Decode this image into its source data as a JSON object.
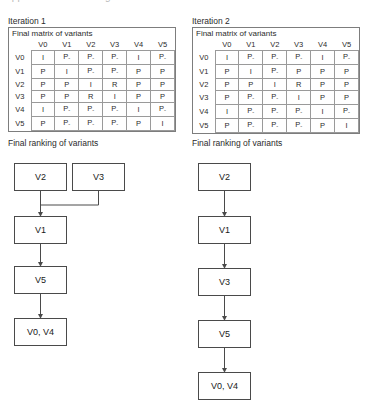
{
  "top_caption": "appendix: final ranking tables",
  "columns": [
    {
      "iteration_title": "Iteration 1",
      "matrix": {
        "caption": "Final matrix of variants",
        "col_headers": [
          "V0",
          "V1",
          "V2",
          "V3",
          "V4",
          "V5"
        ],
        "row_headers": [
          "V0",
          "V1",
          "V2",
          "V3",
          "V4",
          "V5"
        ],
        "rows": [
          [
            "I",
            "P-",
            "P-",
            "P-",
            "I",
            "P-"
          ],
          [
            "P",
            "I",
            "P-",
            "P-",
            "P",
            "P"
          ],
          [
            "P",
            "P",
            "I",
            "R",
            "P",
            "P"
          ],
          [
            "P",
            "P",
            "R",
            "I",
            "P",
            "P"
          ],
          [
            "I",
            "P-",
            "P-",
            "P-",
            "I",
            "P-"
          ],
          [
            "P",
            "P-",
            "P-",
            "P-",
            "P",
            "I"
          ]
        ]
      },
      "ranking": {
        "title": "Final ranking of variants",
        "nodes": [
          {
            "label": "V2",
            "x": 14,
            "y": 163,
            "w": 53,
            "h": 28
          },
          {
            "label": "V3",
            "x": 72,
            "y": 163,
            "w": 53,
            "h": 28
          },
          {
            "label": "V1",
            "x": 14,
            "y": 216,
            "w": 53,
            "h": 28
          },
          {
            "label": "V5",
            "x": 14,
            "y": 266,
            "w": 53,
            "h": 28
          },
          {
            "label": "V0, V4",
            "x": 14,
            "y": 318,
            "w": 53,
            "h": 28
          }
        ]
      }
    },
    {
      "iteration_title": "Iteration 2",
      "matrix": {
        "caption": "Final matrix of variants",
        "col_headers": [
          "V0",
          "V1",
          "V2",
          "V3",
          "V4",
          "V5"
        ],
        "row_headers": [
          "V0",
          "V1",
          "V2",
          "V3",
          "V4",
          "V5"
        ],
        "rows": [
          [
            "I",
            "P-",
            "P-",
            "P-",
            "I",
            "P-"
          ],
          [
            "P",
            "I",
            "P-",
            "P",
            "P",
            "P"
          ],
          [
            "P",
            "P",
            "I",
            "R",
            "P",
            "P"
          ],
          [
            "P",
            "P-",
            "P-",
            "I",
            "P",
            "P"
          ],
          [
            "I",
            "P-",
            "P-",
            "P-",
            "I",
            "P-"
          ],
          [
            "P",
            "P-",
            "P-",
            "P-",
            "P",
            "I"
          ]
        ]
      },
      "ranking": {
        "title": "Final ranking of variants",
        "nodes": [
          {
            "label": "V2",
            "x": 14,
            "y": 163,
            "w": 53,
            "h": 28
          },
          {
            "label": "V1",
            "x": 14,
            "y": 216,
            "w": 53,
            "h": 28
          },
          {
            "label": "V3",
            "x": 14,
            "y": 268,
            "w": 53,
            "h": 28
          },
          {
            "label": "V5",
            "x": 14,
            "y": 320,
            "w": 53,
            "h": 28
          },
          {
            "label": "V0, V4",
            "x": 14,
            "y": 372,
            "w": 53,
            "h": 28
          }
        ]
      }
    }
  ]
}
